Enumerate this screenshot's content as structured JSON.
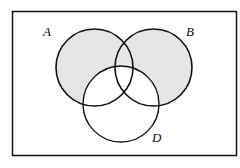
{
  "diagram": {
    "type": "venn",
    "sets": [
      {
        "label": "A",
        "cx": 94.5,
        "cy": 67.5,
        "r": 38.5
      },
      {
        "label": "B",
        "cx": 153.5,
        "cy": 67.5,
        "r": 38.5
      },
      {
        "label": "D",
        "cx": 121,
        "cy": 104,
        "r": 38
      }
    ],
    "shaded_region": "(A ∪ B) − D",
    "colors": {
      "shade": "#e6e6e6",
      "stroke": "#111111",
      "background": "#ffffff"
    }
  },
  "labels": {
    "a": "A",
    "b": "B",
    "d": "D"
  }
}
